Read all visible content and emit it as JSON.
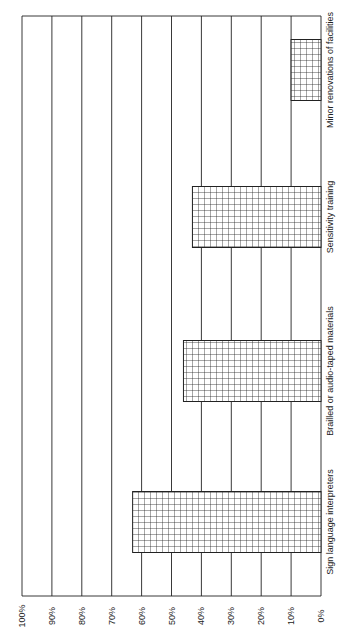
{
  "chart_data": {
    "type": "bar",
    "orientation": "rotated-90 (vertical bars printed sideways)",
    "title": "",
    "xlabel": "",
    "ylabel": "",
    "categories": [
      "Sign language interpreters",
      "Brailled or audio-taped materials",
      "Sensitivity training",
      "Minor renovations of facilities"
    ],
    "values": [
      63,
      46,
      43,
      10
    ],
    "ylim": [
      0,
      100
    ],
    "yticks": [
      "0%",
      "10%",
      "20%",
      "30%",
      "40%",
      "50%",
      "60%",
      "70%",
      "80%",
      "90%",
      "100%"
    ],
    "grid": true,
    "bar_fill": "crosshatch",
    "legend": null
  },
  "colors": {
    "line": "#222222",
    "background": "#ffffff"
  }
}
